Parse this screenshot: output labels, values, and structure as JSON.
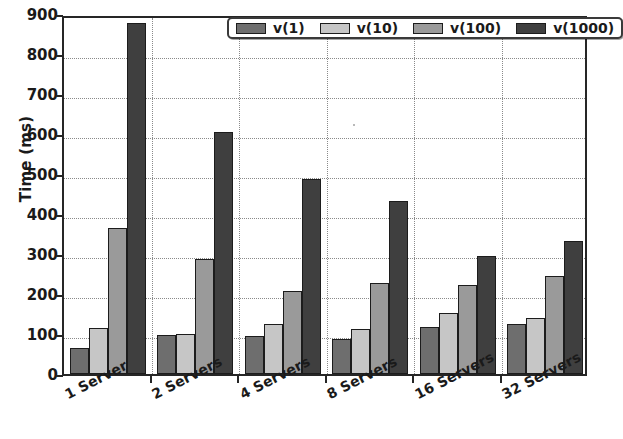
{
  "chart_data": {
    "type": "bar",
    "title": "",
    "xlabel": "",
    "ylabel": "Time (ms)",
    "categories": [
      "1 Server",
      "2 Servers",
      "4 Servers",
      "8 Servers",
      "16 Servers",
      "32 Servers"
    ],
    "series": [
      {
        "name": "v(1)",
        "color": "#6e6e6e",
        "values": [
          65,
          97,
          95,
          88,
          118,
          126
        ]
      },
      {
        "name": "v(10)",
        "color": "#c6c6c6",
        "values": [
          115,
          101,
          124,
          112,
          152,
          139
        ]
      },
      {
        "name": "v(100)",
        "color": "#9a9a9a",
        "values": [
          365,
          288,
          208,
          228,
          222,
          246
        ]
      },
      {
        "name": "v(1000)",
        "color": "#3f3f3f",
        "values": [
          878,
          605,
          487,
          432,
          295,
          332
        ]
      }
    ],
    "ylim": [
      0,
      900
    ],
    "yticks": [
      0,
      100,
      200,
      300,
      400,
      500,
      600,
      700,
      800,
      900
    ],
    "ytick_labels": [
      "0",
      "100",
      "200",
      "300",
      "400",
      "500",
      "600",
      "700",
      "800",
      "900"
    ],
    "grid": "dotted-both",
    "legend_position": "upper center",
    "axis_color": "#262626",
    "grid_color": "#8a8a8a",
    "background": "#ffffff"
  }
}
